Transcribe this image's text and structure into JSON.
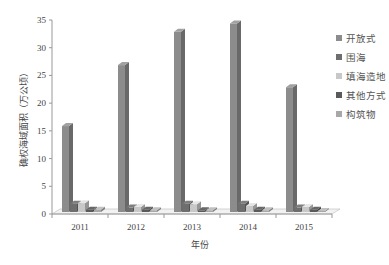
{
  "chart_data": {
    "type": "bar",
    "style": "3d-clustered-column",
    "title": "",
    "xlabel": "年份",
    "ylabel": "确权海域面积（万公顷）",
    "ylim": [
      0,
      35
    ],
    "yticks": [
      0,
      5,
      10,
      15,
      20,
      25,
      30,
      35
    ],
    "categories": [
      "2011",
      "2012",
      "2013",
      "2014",
      "2015"
    ],
    "grid": false,
    "legend_position": "right",
    "series": [
      {
        "name": "开放式",
        "color": "#8c8c8c",
        "values": [
          15.5,
          26.5,
          32.5,
          34.0,
          22.5
        ]
      },
      {
        "name": "围海",
        "color": "#6e6e6e",
        "values": [
          1.5,
          0.8,
          1.5,
          1.5,
          0.8
        ]
      },
      {
        "name": "填海造地",
        "color": "#c8c8c8",
        "values": [
          1.6,
          0.9,
          1.4,
          1.1,
          0.9
        ]
      },
      {
        "name": "其他方式",
        "color": "#5a5a5a",
        "values": [
          0.4,
          0.4,
          0.3,
          0.4,
          0.4
        ]
      },
      {
        "name": "构筑物",
        "color": "#a8a8a8",
        "values": [
          0.4,
          0.3,
          0.3,
          0.3,
          0.2
        ]
      }
    ]
  }
}
